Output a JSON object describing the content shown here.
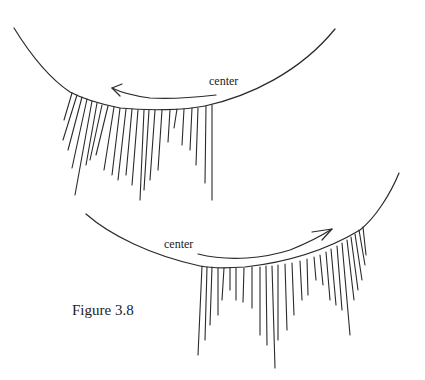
{
  "figure": {
    "caption": "Figure 3.8",
    "stroke_color": "#2a2a2a",
    "background": "#ffffff"
  },
  "top_eye": {
    "label": "center",
    "label_pos": [
      209,
      74
    ],
    "lid_path": "M14,28 C35,62 55,82 70,92 C85,100 100,104 120,108 C150,111 185,110 205,106 C250,96 300,72 335,29",
    "arrow": {
      "direction": "left",
      "path": "M216,95 C190,98 165,99 150,98 C135,96 122,93 112,88",
      "head": "M122,84 L112,88 L120,96"
    },
    "lashes": [
      [
        72,
        93,
        64,
        120
      ],
      [
        77,
        95,
        63,
        140
      ],
      [
        82,
        97,
        68,
        150
      ],
      [
        87,
        99,
        72,
        168
      ],
      [
        92,
        101,
        75,
        195
      ],
      [
        97,
        103,
        86,
        165
      ],
      [
        102,
        105,
        90,
        160
      ],
      [
        108,
        106,
        96,
        155
      ],
      [
        114,
        107,
        104,
        170
      ],
      [
        120,
        108,
        112,
        175
      ],
      [
        126,
        109,
        118,
        180
      ],
      [
        132,
        109,
        126,
        175
      ],
      [
        138,
        110,
        132,
        185
      ],
      [
        144,
        110,
        140,
        200
      ],
      [
        149,
        110,
        144,
        190
      ],
      [
        155,
        110,
        150,
        180
      ],
      [
        162,
        110,
        158,
        170
      ],
      [
        170,
        110,
        168,
        142
      ],
      [
        177,
        109,
        174,
        128
      ],
      [
        184,
        109,
        182,
        145
      ],
      [
        192,
        108,
        190,
        150
      ],
      [
        198,
        108,
        196,
        165
      ],
      [
        206,
        106,
        205,
        183
      ],
      [
        212,
        105,
        212,
        200
      ]
    ]
  },
  "bottom_eye": {
    "label": "center",
    "label_pos": [
      164,
      237
    ],
    "lid_path": "M86,214 C110,235 150,255 200,266 C215,269 230,268 245,267 C290,262 330,248 360,230 C375,218 390,195 399,173",
    "arrow": {
      "direction": "right",
      "path": "M198,254 C230,262 265,258 290,250 C305,244 318,238 332,229",
      "head": "M312,232 L332,229 L322,240"
    },
    "lashes": [
      [
        202,
        266,
        198,
        355
      ],
      [
        207,
        267,
        205,
        340
      ],
      [
        212,
        267,
        210,
        325
      ],
      [
        218,
        268,
        218,
        315
      ],
      [
        224,
        268,
        222,
        300
      ],
      [
        230,
        268,
        230,
        290
      ],
      [
        236,
        268,
        236,
        300
      ],
      [
        244,
        268,
        243,
        302
      ],
      [
        252,
        267,
        252,
        308
      ],
      [
        260,
        267,
        260,
        335
      ],
      [
        266,
        266,
        267,
        345
      ],
      [
        272,
        266,
        275,
        368
      ],
      [
        278,
        265,
        278,
        340
      ],
      [
        285,
        264,
        287,
        330
      ],
      [
        292,
        263,
        294,
        315
      ],
      [
        300,
        261,
        302,
        300
      ],
      [
        307,
        259,
        308,
        295
      ],
      [
        314,
        257,
        316,
        280
      ],
      [
        320,
        255,
        323,
        285
      ],
      [
        326,
        252,
        330,
        300
      ],
      [
        331,
        249,
        336,
        305
      ],
      [
        337,
        246,
        342,
        310
      ],
      [
        342,
        243,
        350,
        335
      ],
      [
        347,
        240,
        354,
        300
      ],
      [
        351,
        237,
        358,
        290
      ],
      [
        355,
        234,
        362,
        280
      ],
      [
        359,
        230,
        365,
        265
      ],
      [
        363,
        227,
        366,
        255
      ]
    ]
  }
}
